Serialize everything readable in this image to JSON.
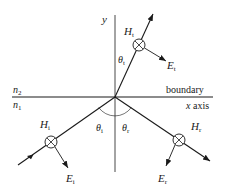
{
  "diagram": {
    "colors": {
      "ink": "#1a1a1a",
      "background": "#ffffff"
    },
    "axes": {
      "y_label": "y",
      "x_label": "x axis",
      "boundary_label": "boundary"
    },
    "media": {
      "upper": {
        "symbol": "n",
        "sub": "2"
      },
      "lower": {
        "symbol": "n",
        "sub": "1"
      }
    },
    "angles": {
      "transmitted": {
        "symbol": "θ",
        "sub": "t"
      },
      "incident": {
        "symbol": "θ",
        "sub": "i"
      },
      "reflected": {
        "symbol": "θ",
        "sub": "r"
      }
    },
    "waves": {
      "transmitted": {
        "H": {
          "symbol": "H",
          "sub": "t"
        },
        "E": {
          "symbol": "E",
          "sub": "t"
        }
      },
      "incident": {
        "H": {
          "symbol": "H",
          "sub": "i"
        },
        "E": {
          "symbol": "E",
          "sub": "i"
        }
      },
      "reflected": {
        "H": {
          "symbol": "H",
          "sub": "r"
        },
        "E": {
          "symbol": "E",
          "sub": "r"
        }
      }
    },
    "icons": {
      "into_page": "circle-with-cross (field pointing into page)"
    }
  }
}
